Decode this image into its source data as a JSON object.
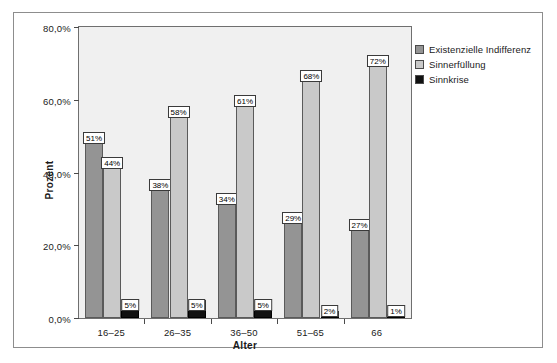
{
  "chart_data": {
    "type": "bar",
    "title": "",
    "xlabel": "Alter",
    "ylabel": "Prozent",
    "categories": [
      "16–25",
      "26–35",
      "36–50",
      "51–65",
      "66"
    ],
    "ylim": [
      0,
      80
    ],
    "ytick_values": [
      0,
      20,
      40,
      60,
      80
    ],
    "ytick_labels": [
      "0,0%",
      "20,0%",
      "40,0%",
      "60,0%",
      "80,0%"
    ],
    "grid": false,
    "legend_position": "right",
    "series": [
      {
        "name": "Existenzielle Indifferenz",
        "color": "#949494",
        "values": [
          51,
          38,
          34,
          29,
          27
        ],
        "labels": [
          "51%",
          "38%",
          "34%",
          "29%",
          "27%"
        ]
      },
      {
        "name": "Sinnerfüllung",
        "color": "#c9c9c9",
        "values": [
          44,
          58,
          61,
          68,
          72
        ],
        "labels": [
          "44%",
          "58%",
          "61%",
          "68%",
          "72%"
        ]
      },
      {
        "name": "Sinnkrise",
        "color": "#111111",
        "values": [
          5,
          5,
          5,
          2,
          1
        ],
        "labels": [
          "5%",
          "5%",
          "5%",
          "2%",
          "1%"
        ]
      }
    ]
  }
}
